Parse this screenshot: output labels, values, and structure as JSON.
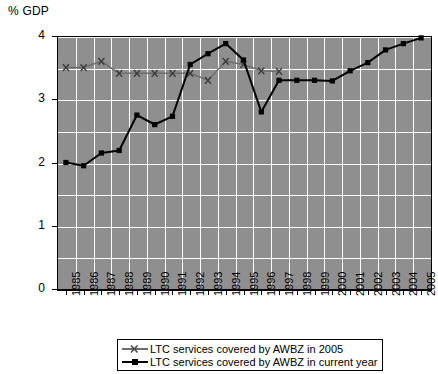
{
  "chart_data": {
    "type": "line",
    "title": "",
    "xlabel": "",
    "ylabel": "% GDP",
    "ylim": [
      0,
      4
    ],
    "ytick_labels": [
      "0",
      "1",
      "2",
      "3",
      "4"
    ],
    "ytick_values": [
      0,
      1,
      2,
      3,
      4
    ],
    "grid": "horizontal and vertical white gridlines on grey panel, minor horizontal gridlines every 0.5",
    "minor_ytick_values": [
      0.5,
      1.5,
      2.5,
      3.5
    ],
    "legend_position": "below plot, centered, boxed",
    "categories": [
      "1985",
      "1986",
      "1987",
      "1988",
      "1989",
      "1990",
      "1991",
      "1992",
      "1993",
      "1994",
      "1995",
      "1996",
      "1997",
      "1998",
      "1999",
      "2000",
      "2001",
      "2002",
      "2003",
      "2004",
      "2005"
    ],
    "series": [
      {
        "name": "LTC services covered by AWBZ in 2005",
        "color": "#6e6e6e",
        "marker": "x",
        "values": [
          3.5,
          3.5,
          3.6,
          3.41,
          3.41,
          3.41,
          3.41,
          3.41,
          3.3,
          3.6,
          3.55,
          3.45,
          3.44,
          null,
          null,
          null,
          null,
          null,
          null,
          null,
          null
        ]
      },
      {
        "name": "LTC services covered by AWBZ in current year",
        "color": "#000000",
        "marker": "square",
        "values": [
          2.0,
          1.95,
          2.15,
          2.19,
          2.75,
          2.6,
          2.73,
          3.55,
          3.72,
          3.88,
          3.62,
          2.8,
          3.3,
          3.3,
          3.3,
          3.29,
          3.45,
          3.58,
          3.78,
          3.88,
          3.97
        ]
      }
    ]
  },
  "axis": {
    "y_title": "% GDP"
  },
  "legend": {
    "items": [
      {
        "label": "LTC services covered by AWBZ in 2005",
        "marker": "x",
        "color": "#6e6e6e"
      },
      {
        "label": "LTC services covered by AWBZ in current year",
        "marker": "square",
        "color": "#000000"
      }
    ]
  }
}
